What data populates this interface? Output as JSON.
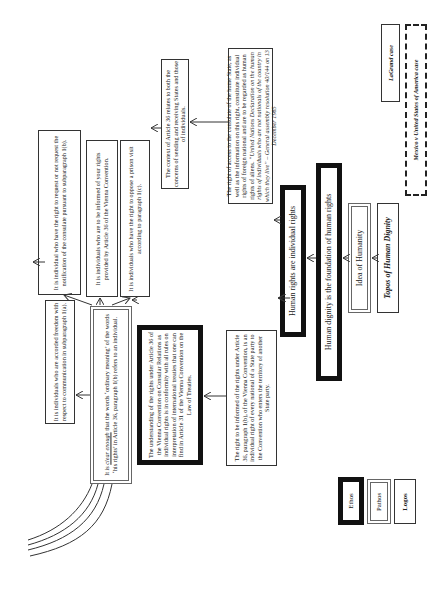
{
  "diagram": {
    "orientation": "rotated-90-ccw",
    "cases": {
      "lagrand": "LaGrand case",
      "avena": "Mexico v United States of America case"
    },
    "topos": "Topos of Human Dignity",
    "idea_of_humanity": "Idea of Humanity",
    "dignity_foundation": "Human dignity is the foundation of human rights",
    "individual_rights": "Human rights are individual rights",
    "un_declaration": {
      "line1": "The right of access to the consulate of the home State, as well as the information on this right, constitute individual rights of foreign national and are to be regarded as human rights of aliens.",
      "quote": "“United Nations Declaration on the human rights of individuals who are not nationals of the country in which they live” – General assembly resolution 40/144 on 13 December 1985"
    },
    "right_informed": "The right to be informed of the rights under Article 36, paragraph 1(b), of the Vienna Convention, is an individual right of every national of a State party to the Convention who enters the territory of another State party.",
    "context_article": "The context of Article 36 relates to both the concerns of sending and receiving States and those of individuals.",
    "understanding": "The understanding of the rights under Article 36 of the Vienna Convention on Consular Relations as individual rights is in conformity with all rules on interpretation of international treaties that one can find in Article 31 of the Vienna Convention on the Law of Treaties.",
    "clear_enough": {
      "emph": "clear enough",
      "pre": "It is ",
      "post": " that the words ‘ordinary meaning’ of the words ‘his rights’ in Article 36, paragraph 1(b) refers to an individual."
    },
    "freedom": "It is individuals who are accorded freedom with respect to communication in subparagraph 1(a).",
    "notification": "It is individual who have the right to request or not request the notification of the consulate pursuant to subparagraph 1(b).",
    "informed": "It is individuals who are to be informed of your rights provided by Article 36 of the Vienna Convention.",
    "oppose": "It is individuals who have the right to oppose a prison visit according to paragraph 1(c).",
    "legend": {
      "ethos": "Ethos",
      "pathos": "Pathos",
      "logos": "Logos"
    }
  }
}
